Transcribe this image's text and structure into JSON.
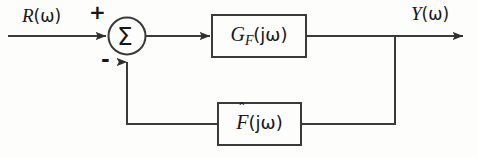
{
  "diagram": {
    "type": "closed-loop-feedback-block-diagram",
    "stroke_color": "#3a3a3c",
    "text_color": "#17171a",
    "background_color": "#fdfdfc",
    "input": {
      "label_var": "R",
      "label_arg": "(ω)"
    },
    "output": {
      "label_var": "Y",
      "label_arg": "(ω)"
    },
    "summing_junction": {
      "symbol": "Σ",
      "plus_sign": "+",
      "minus_sign": "-"
    },
    "forward_block": {
      "main": "G",
      "subscript": "F",
      "argument": "(jω)"
    },
    "feedback_block": {
      "accent": "ˆ",
      "main": "F",
      "argument": "(jω)"
    }
  }
}
